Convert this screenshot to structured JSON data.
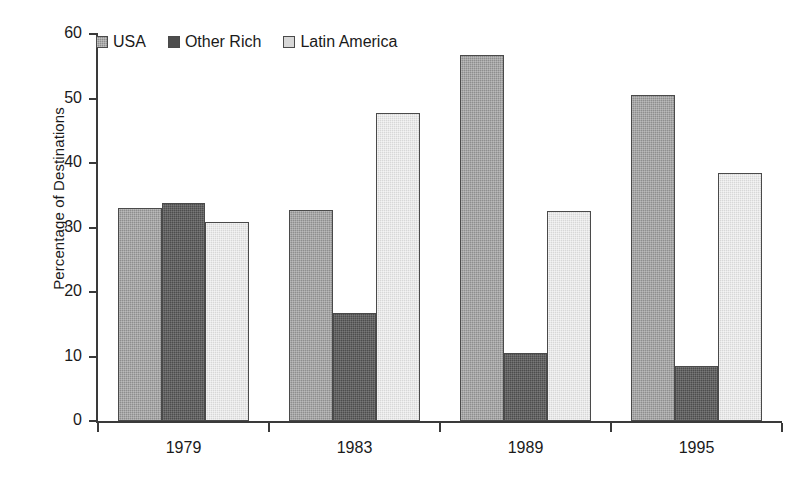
{
  "chart_data": {
    "type": "bar",
    "title": "",
    "subtitle": "",
    "xlabel": "",
    "ylabel": "Percentage of Destinations",
    "categories": [
      "1979",
      "1983",
      "1989",
      "1995"
    ],
    "ylim": [
      0,
      60
    ],
    "yticks": [
      0,
      10,
      20,
      30,
      40,
      50,
      60
    ],
    "ytick_labels": [
      "0",
      "10",
      "20",
      "30",
      "40",
      "50",
      "60"
    ],
    "grid": false,
    "legend_position": "top-left",
    "series": [
      {
        "name": "USA",
        "color": "#8e8e8e",
        "values": [
          33.0,
          32.7,
          56.8,
          50.5
        ]
      },
      {
        "name": "Other Rich",
        "color": "#4d4d4d",
        "values": [
          33.8,
          16.8,
          10.5,
          8.5
        ]
      },
      {
        "name": "Latin America",
        "color": "#d7d7d7",
        "values": [
          30.9,
          47.8,
          32.5,
          38.4
        ]
      }
    ]
  },
  "legend": {
    "items": [
      {
        "label": "USA",
        "swatch": "usa-swatch-icon"
      },
      {
        "label": "Other Rich",
        "swatch": "other-rich-swatch-icon"
      },
      {
        "label": "Latin America",
        "swatch": "latin-america-swatch-icon"
      }
    ]
  },
  "axes": {
    "y_title": "Percentage of Destinations",
    "y_labels": [
      "60",
      "50",
      "40",
      "30",
      "20",
      "10",
      "0"
    ],
    "x_labels": [
      "1979",
      "1983",
      "1989",
      "1995"
    ]
  },
  "colors": {
    "axis": "#3a3a3a",
    "bar_outline": "#4a4a4a",
    "text": "#1a1a1a",
    "background": "#ffffff",
    "series_usa": "#8e8e8e",
    "series_other_rich": "#4d4d4d",
    "series_latin_america": "#d7d7d7"
  }
}
